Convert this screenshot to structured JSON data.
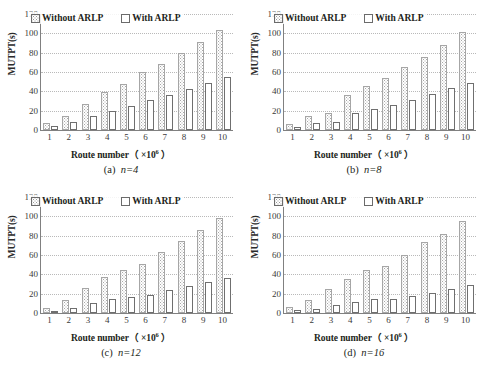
{
  "figure": {
    "panels": [
      "a",
      "b",
      "c",
      "d"
    ]
  },
  "legend": {
    "series_without": "Without ARLP",
    "series_with": "With ARLP",
    "swatch_without": "hatched-dotted-square-icon",
    "swatch_with": "white-square-icon"
  },
  "axis": {
    "ylabel": "MUTPT(s)",
    "xlabel_prefix": "Route number（",
    "xlabel_mult": "×10",
    "xlabel_exp": "6",
    "xlabel_suffix": "）",
    "yticks": [
      "120",
      "100",
      "80",
      "60",
      "40",
      "20",
      "0"
    ],
    "xticks": [
      "1",
      "2",
      "3",
      "4",
      "5",
      "6",
      "7",
      "8",
      "9",
      "10"
    ]
  },
  "captions": {
    "a_prefix": "(a)",
    "a_value": "n=4",
    "b_prefix": "(b)",
    "b_value": "n=8",
    "c_prefix": "(c)",
    "c_value": "n=12",
    "d_prefix": "(d)",
    "d_value": "n=16"
  },
  "chart_data": [
    {
      "id": "a",
      "type": "bar",
      "title": "(a) n=4",
      "xlabel": "Route number ( ×10^6 )",
      "ylabel": "MUTPT(s)",
      "ylim": [
        0,
        120
      ],
      "ytick_step": 20,
      "grid": true,
      "legend_position": "top-center",
      "categories": [
        "1",
        "2",
        "3",
        "4",
        "5",
        "6",
        "7",
        "8",
        "9",
        "10"
      ],
      "series": [
        {
          "name": "Without ARLP",
          "values": [
            7,
            15,
            27,
            39,
            48,
            60,
            68,
            80,
            91,
            103
          ]
        },
        {
          "name": "With ARLP",
          "values": [
            4,
            8,
            15,
            20,
            25,
            31,
            36,
            42,
            49,
            55
          ]
        }
      ]
    },
    {
      "id": "b",
      "type": "bar",
      "title": "(b) n=8",
      "xlabel": "Route number ( ×10^6 )",
      "ylabel": "MUTPT(s)",
      "ylim": [
        0,
        120
      ],
      "ytick_step": 20,
      "grid": true,
      "legend_position": "top-center",
      "categories": [
        "1",
        "2",
        "3",
        "4",
        "5",
        "6",
        "7",
        "8",
        "9",
        "10"
      ],
      "series": [
        {
          "name": "Without ARLP",
          "values": [
            6,
            14,
            18,
            36,
            46,
            54,
            65,
            76,
            88,
            101
          ]
        },
        {
          "name": "With ARLP",
          "values": [
            3,
            7,
            8,
            18,
            22,
            26,
            31,
            37,
            43,
            49
          ]
        }
      ]
    },
    {
      "id": "c",
      "type": "bar",
      "title": "(c) n=12",
      "xlabel": "Route number ( ×10^6 )",
      "ylabel": "MUTPT(s)",
      "ylim": [
        0,
        120
      ],
      "ytick_step": 20,
      "grid": true,
      "legend_position": "top-center",
      "categories": [
        "1",
        "2",
        "3",
        "4",
        "5",
        "6",
        "7",
        "8",
        "9",
        "10"
      ],
      "series": [
        {
          "name": "Without ARLP",
          "values": [
            5,
            13,
            26,
            37,
            45,
            51,
            63,
            75,
            86,
            98
          ]
        },
        {
          "name": "With ARLP",
          "values": [
            2,
            5,
            10,
            14,
            17,
            19,
            24,
            28,
            32,
            36
          ]
        }
      ]
    },
    {
      "id": "d",
      "type": "bar",
      "title": "(d) n=16",
      "xlabel": "Route number ( ×10^6 )",
      "ylabel": "MUTPT(s)",
      "ylim": [
        0,
        120
      ],
      "ytick_step": 20,
      "grid": true,
      "legend_position": "top-center",
      "categories": [
        "1",
        "2",
        "3",
        "4",
        "5",
        "6",
        "7",
        "8",
        "9",
        "10"
      ],
      "series": [
        {
          "name": "Without ARLP",
          "values": [
            6,
            13,
            25,
            35,
            44,
            49,
            60,
            73,
            82,
            95
          ]
        },
        {
          "name": "With ARLP",
          "values": [
            3,
            4,
            8,
            11,
            14,
            15,
            18,
            21,
            25,
            29
          ]
        }
      ]
    }
  ]
}
